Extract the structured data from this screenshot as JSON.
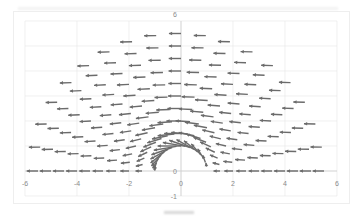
{
  "chart_data": {
    "type": "vector_field",
    "title": "",
    "caption": "",
    "xlabel": "",
    "ylabel": "",
    "xlim": [
      -6,
      6
    ],
    "ylim": [
      -1,
      6
    ],
    "x_ticks": [
      -6,
      -4,
      -2,
      0,
      2,
      4,
      6
    ],
    "y_ticks": [
      -1,
      0,
      6
    ],
    "y_tick_labels_shown": [
      "6",
      "0",
      "-1"
    ],
    "x_tick_labels": [
      "-6",
      "-4",
      "-2",
      "0",
      "2",
      "4",
      "6"
    ],
    "grid": {
      "x_major_step": 2,
      "y_major_step": 1
    },
    "legend": "none",
    "cylinder_radius": 1,
    "free_stream": -1,
    "polar_grid": {
      "r_min": 1.0,
      "r_max": 5.5,
      "r_step": 0.5,
      "theta_min_deg": 0,
      "theta_max_deg": 180,
      "theta_step_deg": 10
    },
    "arrow_scale": 0.45,
    "colors": {
      "arrow": "#6b6b6b",
      "grid": "#e6e6e6",
      "axis": "#d0d0d0",
      "tick_text": "#8a8a8a"
    }
  }
}
